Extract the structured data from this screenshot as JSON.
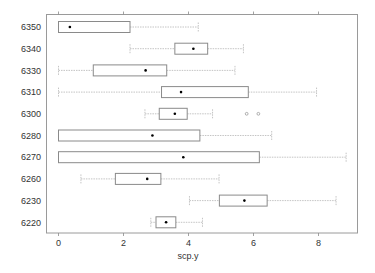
{
  "chart_data": {
    "type": "box",
    "orientation": "horizontal",
    "title": "",
    "xlabel": "scp.y",
    "ylabel": "",
    "xlim": [
      -0.4,
      9.2
    ],
    "x_ticks": [
      0,
      2,
      4,
      6,
      8
    ],
    "x_tick_labels": [
      "0",
      "2",
      "4",
      "6",
      "8"
    ],
    "grid": false,
    "legend": null,
    "categories": [
      "6350",
      "6340",
      "6330",
      "6310",
      "6300",
      "6280",
      "6270",
      "6260",
      "6230",
      "6220"
    ],
    "series": [
      {
        "category": "6350",
        "whisker_low": 0.0,
        "q1": 0.0,
        "q3": 2.2,
        "whisker_high": 4.3,
        "center_dot": 0.35,
        "outliers": []
      },
      {
        "category": "6340",
        "whisker_low": 2.2,
        "q1": 3.58,
        "q3": 4.59,
        "whisker_high": 5.69,
        "center_dot": 4.15,
        "outliers": []
      },
      {
        "category": "6330",
        "whisker_low": 0.0,
        "q1": 1.07,
        "q3": 3.33,
        "whisker_high": 5.43,
        "center_dot": 2.68,
        "outliers": []
      },
      {
        "category": "6310",
        "whisker_low": 0.0,
        "q1": 3.17,
        "q3": 5.84,
        "whisker_high": 7.94,
        "center_dot": 3.77,
        "outliers": []
      },
      {
        "category": "6300",
        "whisker_low": 2.66,
        "q1": 3.1,
        "q3": 3.96,
        "whisker_high": 4.74,
        "center_dot": 3.58,
        "outliers": [
          5.79,
          6.15
        ]
      },
      {
        "category": "6280",
        "whisker_low": 0.0,
        "q1": 0.0,
        "q3": 4.35,
        "whisker_high": 6.56,
        "center_dot": 2.89,
        "outliers": []
      },
      {
        "category": "6270",
        "whisker_low": 0.0,
        "q1": 0.0,
        "q3": 6.18,
        "whisker_high": 8.85,
        "center_dot": 3.84,
        "outliers": []
      },
      {
        "category": "6260",
        "whisker_low": 0.69,
        "q1": 1.75,
        "q3": 3.15,
        "whisker_high": 4.94,
        "center_dot": 2.73,
        "outliers": []
      },
      {
        "category": "6230",
        "whisker_low": 4.03,
        "q1": 4.95,
        "q3": 6.42,
        "whisker_high": 8.54,
        "center_dot": 5.72,
        "outliers": []
      },
      {
        "category": "6220",
        "whisker_low": 2.84,
        "q1": 3.0,
        "q3": 3.61,
        "whisker_high": 4.43,
        "center_dot": 3.31,
        "outliers": []
      }
    ]
  },
  "colors": {
    "panel_border": "#9a9a9a",
    "box_border": "#8a8a8a",
    "whisker": "#b5b5b5",
    "center_dot": "#000000",
    "text": "#333333"
  }
}
